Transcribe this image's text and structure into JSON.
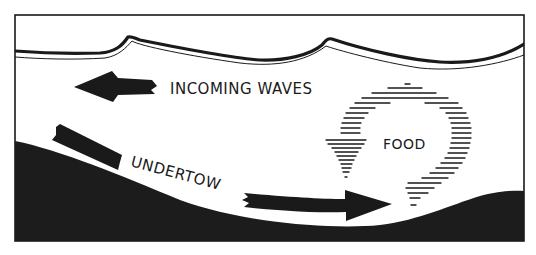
{
  "diagram": {
    "type": "illustration",
    "labels": {
      "incoming": "INCOMING WAVES",
      "undertow": "UNDERTOW",
      "food": "FOOD"
    },
    "elements": [
      {
        "name": "water-surface",
        "description": "wavy surface line with two wave crests"
      },
      {
        "name": "incoming-waves-arrow",
        "direction": "left",
        "label": "INCOMING WAVES"
      },
      {
        "name": "undertow-arrow",
        "direction": "down-slope then right",
        "label": "UNDERTOW"
      },
      {
        "name": "food-circulation",
        "description": "hatched circular arrow looping counter-clockwise",
        "label": "FOOD"
      },
      {
        "name": "seabed",
        "description": "dark sloping sea floor rising to the right"
      }
    ],
    "colors": {
      "ink": "#1a1a1a",
      "paper": "#ffffff",
      "seabed": "#1c1c1c"
    }
  }
}
